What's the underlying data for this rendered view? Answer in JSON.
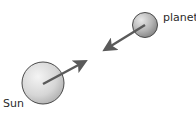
{
  "diagram": {
    "type": "gravitational-attraction",
    "bodies": [
      {
        "id": "sun",
        "label": "Sun",
        "cx": 43,
        "cy": 83,
        "r": 21
      },
      {
        "id": "planet",
        "label": "planet",
        "cx": 145,
        "cy": 25,
        "r": 12.5
      }
    ],
    "arrows": [
      {
        "id": "force-on-sun",
        "from": [
          43,
          84
        ],
        "to": [
          86,
          61
        ]
      },
      {
        "id": "force-on-planet",
        "from": [
          145,
          25
        ],
        "to": [
          104,
          50
        ]
      }
    ],
    "colors": {
      "arrow": "#5a5a5a",
      "outline": "#4a4a4a",
      "fill_light": "#f2f2f2",
      "fill_dark": "#a8a8a8",
      "text": "#2a2a2a"
    }
  }
}
